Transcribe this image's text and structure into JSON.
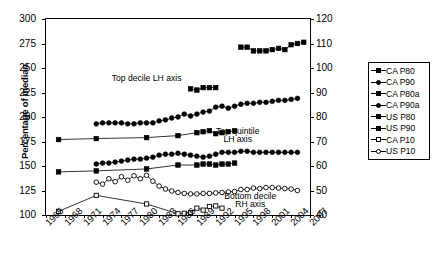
{
  "chart_data": {
    "type": "line",
    "title": "",
    "xlabel": "",
    "ylabel": "Percentage of median",
    "ylabel_right": "Percentage of median",
    "xlim": [
      1965,
      2007
    ],
    "ylim": [
      100,
      300
    ],
    "ylim_right": [
      40,
      120
    ],
    "xticks": [
      1965,
      1968,
      1971,
      1974,
      1977,
      1980,
      1983,
      1986,
      1989,
      1992,
      1995,
      1998,
      2001,
      2004,
      2007
    ],
    "yticks": [
      100,
      125,
      150,
      175,
      200,
      225,
      250,
      275,
      300
    ],
    "yticks_right": [
      40,
      50,
      60,
      70,
      80,
      90,
      100,
      110,
      120
    ],
    "grid": false,
    "legend_position": "right",
    "annotations": [
      {
        "text": "Top decile LH axis",
        "x": 1981,
        "y": 237
      },
      {
        "text": "Top quintile",
        "x": 1995.5,
        "y": 183
      },
      {
        "text": "LH axis",
        "x": 1995.5,
        "y": 175
      },
      {
        "text": "Bottom decile",
        "x": 1997.5,
        "y": 116
      },
      {
        "text": "RH axis",
        "x": 1997.5,
        "y": 108
      }
    ],
    "series": [
      {
        "name": "CA P80",
        "axis": "left",
        "marker": "filled-square",
        "x": [
          1967,
          1973,
          1981,
          1986,
          1989,
          1990,
          1991,
          1992,
          1993,
          1994,
          1995
        ],
        "values": [
          177,
          178,
          179,
          181,
          184,
          185,
          186,
          183,
          184,
          185,
          186
        ]
      },
      {
        "name": "CA P90",
        "axis": "left",
        "marker": "filled-circle",
        "x": [
          1973,
          1974,
          1975,
          1976,
          1977,
          1978,
          1979,
          1980,
          1981,
          1982,
          1983,
          1984,
          1985,
          1986,
          1987,
          1988,
          1989,
          1990,
          1991,
          1992,
          1993,
          1994,
          1995,
          1996,
          1997,
          1998,
          1999,
          2000,
          2001,
          2002,
          2003,
          2004,
          2005
        ],
        "values": [
          193,
          194,
          194,
          194,
          194,
          193,
          193,
          194,
          194,
          194,
          196,
          197,
          199,
          200,
          203,
          201,
          203,
          205,
          206,
          210,
          211,
          209,
          211,
          213,
          214,
          214,
          215,
          215,
          216,
          217,
          217,
          218,
          219
        ]
      },
      {
        "name": "CA P80a",
        "axis": "left",
        "marker": "filled-square",
        "x": [
          1967,
          1973,
          1981,
          1986,
          1989,
          1990,
          1991,
          1992,
          1993,
          1994,
          1995
        ],
        "values": [
          144,
          145,
          147,
          151,
          151,
          152,
          152,
          151,
          152,
          152,
          153
        ]
      },
      {
        "name": "CA P90a",
        "axis": "left",
        "marker": "filled-circle",
        "x": [
          1973,
          1974,
          1975,
          1976,
          1977,
          1978,
          1979,
          1980,
          1981,
          1982,
          1983,
          1984,
          1985,
          1986,
          1987,
          1988,
          1989,
          1990,
          1991,
          1992,
          1993,
          1994,
          1995,
          1996,
          1997,
          1998,
          1999,
          2000,
          2001,
          2002,
          2003,
          2004,
          2005
        ],
        "values": [
          152,
          153,
          153,
          154,
          155,
          156,
          157,
          157,
          158,
          159,
          161,
          162,
          162,
          163,
          162,
          161,
          160,
          159,
          160,
          162,
          164,
          164,
          164,
          165,
          165,
          164,
          164,
          164,
          164,
          164,
          164,
          164,
          164
        ]
      },
      {
        "name": "US P80",
        "axis": "right",
        "marker": "filled-square",
        "x": [
          1996,
          1997,
          1998,
          1999,
          2000,
          2001,
          2002,
          2003,
          2004,
          2005,
          2006
        ],
        "values": [
          108.5,
          108.5,
          107.0,
          107.0,
          107.0,
          107.5,
          108.0,
          107.5,
          109.5,
          110.0,
          110.5
        ]
      },
      {
        "name": "US P90",
        "axis": "right",
        "marker": "filled-square",
        "x": [
          1988,
          1989,
          1990,
          1991,
          1992
        ],
        "values": [
          91.5,
          91.0,
          92.0,
          92.0,
          92.0
        ]
      },
      {
        "name": "CA P10",
        "axis": "right",
        "marker": "open-square",
        "x": [
          1967,
          1973,
          1981,
          1986,
          1987,
          1988,
          1989,
          1990,
          1991,
          1992,
          1993
        ],
        "values": [
          41.5,
          48.0,
          44.5,
          40.5,
          40.7,
          41.0,
          42.8,
          42.0,
          43.5,
          43.7,
          42.8
        ]
      },
      {
        "name": "US P10",
        "axis": "right",
        "marker": "open-circle",
        "x": [
          1973,
          1974,
          1975,
          1976,
          1977,
          1978,
          1979,
          1980,
          1981,
          1982,
          1983,
          1984,
          1985,
          1986,
          1987,
          1988,
          1989,
          1990,
          1991,
          1992,
          1993,
          1994,
          1995,
          1996,
          1997,
          1998,
          1999,
          2000,
          2001,
          2002,
          2003,
          2004,
          2005
        ],
        "values": [
          53.4,
          52.6,
          54.8,
          53.6,
          55.6,
          54.2,
          56.0,
          54.8,
          56.2,
          53.8,
          51.8,
          50.6,
          49.8,
          49.2,
          48.8,
          48.6,
          48.6,
          48.8,
          48.8,
          49.0,
          49.2,
          49.4,
          49.6,
          50.4,
          50.4,
          51.0,
          50.8,
          51.2,
          51.2,
          51.0,
          50.8,
          50.6,
          50.0
        ]
      }
    ]
  },
  "legend": {
    "items": [
      {
        "label": "CA P80",
        "marker": "filled-square"
      },
      {
        "label": "CA P90",
        "marker": "filled-circle"
      },
      {
        "label": "CA P80a",
        "marker": "filled-square"
      },
      {
        "label": "CA P90a",
        "marker": "filled-circle"
      },
      {
        "label": "US P80",
        "marker": "filled-square"
      },
      {
        "label": "US P90",
        "marker": "filled-square"
      },
      {
        "label": "CA P10",
        "marker": "open-square"
      },
      {
        "label": "US P10",
        "marker": "open-circle"
      }
    ]
  }
}
